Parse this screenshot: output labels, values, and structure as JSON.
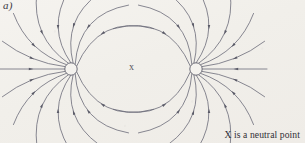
{
  "figure": {
    "panel_label": "a)",
    "neutral_point_marker": "x",
    "caption": "X is a neutral point",
    "background_color": "#f2f0ec",
    "line_color": "#6b6b78",
    "arrow_color": "#5a5a67",
    "charge_fill": "#f4f2ee",
    "charge_stroke": "#5f5f6c"
  },
  "diagram_data": {
    "type": "field-line-diagram",
    "description": "Electric field lines of two identical point charges; all field lines point inward toward both charges, with a neutral point midway between them.",
    "width": 305,
    "height": 143,
    "field_direction": "inward",
    "charges": [
      {
        "id": "left-charge",
        "cx": 71,
        "cy": 69,
        "r": 6.2,
        "polarity": "sink"
      },
      {
        "id": "right-charge",
        "cx": 196,
        "cy": 69,
        "r": 6.2,
        "polarity": "sink"
      }
    ],
    "neutral_point": {
      "x": 133.5,
      "y": 68,
      "label": "x"
    },
    "lines_per_charge": 12,
    "left_lines": [
      {
        "angle": 180,
        "bend": 0.0,
        "len": 71,
        "arrow": 0.52
      },
      {
        "angle": 158,
        "bend": -0.3,
        "len": 74,
        "arrow": 0.5
      },
      {
        "angle": 136,
        "bend": -0.52,
        "len": 80,
        "arrow": 0.5
      },
      {
        "angle": 114,
        "bend": -0.66,
        "len": 84,
        "arrow": 0.5
      },
      {
        "angle": 92,
        "bend": -0.7,
        "len": 78,
        "arrow": 0.5
      },
      {
        "angle": 70,
        "bend": -0.74,
        "len": 80,
        "arrow": 0.48
      },
      {
        "angle": 48,
        "bend": -0.86,
        "len": 86,
        "arrow": 0.46
      },
      {
        "angle": 26,
        "bend": -0.96,
        "len": 92,
        "arrow": 0.44
      },
      {
        "angle": 334,
        "bend": 0.96,
        "len": 92,
        "arrow": 0.44
      },
      {
        "angle": 312,
        "bend": 0.86,
        "len": 86,
        "arrow": 0.46
      },
      {
        "angle": 290,
        "bend": 0.74,
        "len": 80,
        "arrow": 0.48
      },
      {
        "angle": 268,
        "bend": 0.7,
        "len": 78,
        "arrow": 0.5
      },
      {
        "angle": 246,
        "bend": 0.66,
        "len": 84,
        "arrow": 0.5
      },
      {
        "angle": 224,
        "bend": 0.52,
        "len": 80,
        "arrow": 0.5
      },
      {
        "angle": 202,
        "bend": 0.3,
        "len": 74,
        "arrow": 0.5
      }
    ]
  }
}
